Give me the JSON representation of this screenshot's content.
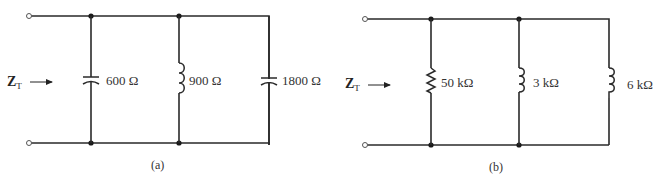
{
  "diagram": {
    "type": "parallel-ac-circuits",
    "circuits": [
      {
        "id": "a",
        "caption": "(a)",
        "input_label": "Z",
        "input_label_sub": "T",
        "branches": [
          {
            "element": "capacitor",
            "label": "600 Ω"
          },
          {
            "element": "inductor",
            "label": "900 Ω"
          },
          {
            "element": "capacitor",
            "label": "1800 Ω"
          }
        ]
      },
      {
        "id": "b",
        "caption": "(b)",
        "input_label": "Z",
        "input_label_sub": "T",
        "branches": [
          {
            "element": "resistor",
            "label": "50 kΩ"
          },
          {
            "element": "inductor",
            "label": "3 kΩ"
          },
          {
            "element": "inductor",
            "label": "6 kΩ"
          }
        ]
      }
    ]
  }
}
